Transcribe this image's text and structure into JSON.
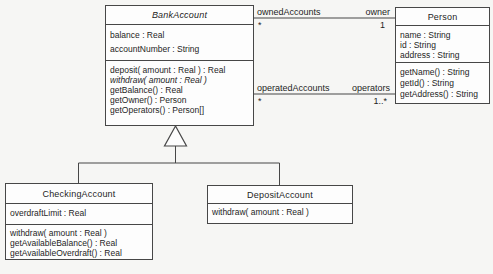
{
  "diagram": {
    "classes": {
      "bank_account": {
        "name": "BankAccount",
        "abstract": true,
        "attributes": [
          "balance : Real",
          "accountNumber : String"
        ],
        "operations": [
          "deposit( amount : Real ) : Real",
          "withdraw( amount : Real )",
          "getBalance() : Real",
          "getOwner() : Person",
          "getOperators() : Person[]"
        ]
      },
      "person": {
        "name": "Person",
        "attributes": [
          "name : String",
          "id : String",
          "address : String"
        ],
        "operations": [
          "getName() : String",
          "getId() : String",
          "getAddress() : String"
        ]
      },
      "checking_account": {
        "name": "CheckingAccount",
        "attributes": [
          "overdraftLimit : Real"
        ],
        "operations": [
          "withdraw( amount : Real )",
          "getAvailableBalance() : Real",
          "getAvailableOverdraft() : Real"
        ]
      },
      "deposit_account": {
        "name": "DepositAccount",
        "operations": [
          "withdraw( amount : Real )"
        ]
      }
    },
    "associations": {
      "owned": {
        "role_account_end": "ownedAccounts",
        "mult_account_end": "*",
        "role_person_end": "owner",
        "mult_person_end": "1"
      },
      "operated": {
        "role_account_end": "operatedAccounts",
        "mult_account_end": "*",
        "role_person_end": "operators",
        "mult_person_end": "1..*"
      }
    },
    "colors": {
      "line": "#474747",
      "box_fill": "#fdfdfd",
      "background": "#f6f6f4",
      "text": "#1e1e1e"
    }
  }
}
